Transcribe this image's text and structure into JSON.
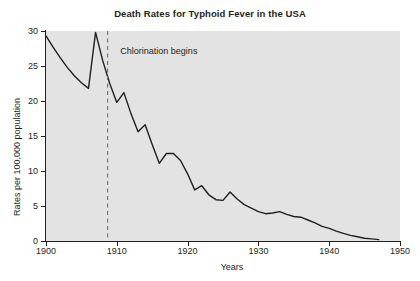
{
  "chart_data": {
    "type": "line",
    "title": "Death Rates for Typhoid Fever in the USA",
    "xlabel": "Years",
    "ylabel": "Rates per 100,000 population",
    "xlim": [
      1900,
      1950
    ],
    "ylim": [
      0,
      30
    ],
    "xticks": [
      1900,
      1910,
      1920,
      1930,
      1940,
      1950
    ],
    "xtick_labels": [
      "1900",
      "1910",
      "1920",
      "1930",
      "1940",
      "1950"
    ],
    "yticks": [
      0,
      5,
      10,
      15,
      20,
      25,
      30
    ],
    "ytick_labels": [
      "0",
      "5",
      "10",
      "15",
      "20",
      "25",
      "30"
    ],
    "grid": false,
    "legend": null,
    "plot_background_color": "#e3e3e3",
    "line_color": "#231f20",
    "annotations": [
      {
        "text": "Chlorination begins",
        "x": 1908.7,
        "style": "vertical-dashed-line",
        "color": "#6d6e71",
        "label_x": 1910.5,
        "label_y": 27.2
      }
    ],
    "series": [
      {
        "name": "Typhoid fever death rate",
        "x": [
          1900,
          1901,
          1902,
          1903,
          1904,
          1905,
          1906,
          1907,
          1908,
          1909,
          1910,
          1911,
          1912,
          1913,
          1914,
          1915,
          1916,
          1917,
          1918,
          1919,
          1920,
          1921,
          1922,
          1923,
          1924,
          1925,
          1926,
          1927,
          1928,
          1929,
          1930,
          1931,
          1932,
          1933,
          1934,
          1935,
          1936,
          1937,
          1938,
          1939,
          1940,
          1941,
          1942,
          1943,
          1944,
          1945,
          1946,
          1947
        ],
        "values": [
          29.3,
          27.7,
          26.2,
          24.8,
          23.6,
          22.6,
          21.8,
          29.8,
          25.8,
          22.5,
          19.8,
          21.2,
          18.2,
          15.6,
          16.6,
          13.8,
          11.1,
          12.5,
          12.5,
          11.5,
          9.6,
          7.3,
          7.9,
          6.6,
          5.9,
          5.8,
          7.0,
          6.0,
          5.2,
          4.7,
          4.2,
          3.9,
          4.0,
          4.2,
          3.8,
          3.5,
          3.4,
          3.0,
          2.6,
          2.1,
          1.8,
          1.4,
          1.1,
          0.8,
          0.6,
          0.4,
          0.3,
          0.2
        ]
      }
    ]
  }
}
